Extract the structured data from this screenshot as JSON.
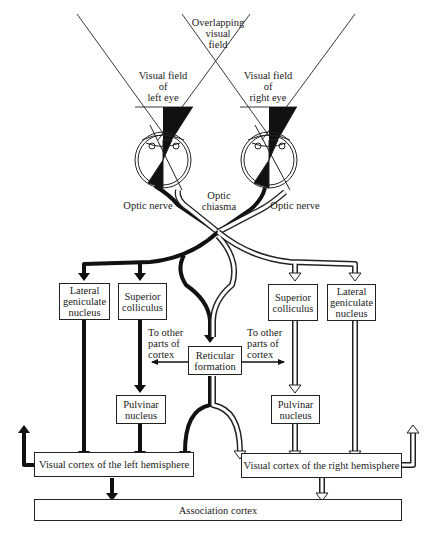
{
  "colors": {
    "left_pathway": "#111111",
    "right_pathway": "#ffffff",
    "outline": "#222222",
    "background": "#ffffff"
  },
  "visual_fields": {
    "overlap": "Overlapping\nvisual\nfield",
    "left_eye": "Visual field\nof\nleft eye",
    "right_eye": "Visual field\nof\nright eye"
  },
  "labels": {
    "optic_nerve_left": "Optic nerve",
    "optic_nerve_right": "Optic nerve",
    "optic_chiasma": "Optic\nchiasma",
    "to_other_left": "To other\nparts of\ncortex",
    "to_other_right": "To other\nparts of\ncortex"
  },
  "nodes": {
    "lgn_left": "Lateral\ngeniculate\nnucleus",
    "sc_left": "Superior\ncolliculus",
    "reticular": "Reticular\nformation",
    "sc_right": "Superior\ncolliculus",
    "lgn_right": "Lateral\ngeniculate\nnucleus",
    "pulvinar_left": "Pulvinar\nnucleus",
    "pulvinar_right": "Pulvinar\nnucleus",
    "vc_left": "Visual cortex of the left hemisphere",
    "vc_right": "Visual cortex of the right hemisphere",
    "association": "Association cortex"
  }
}
